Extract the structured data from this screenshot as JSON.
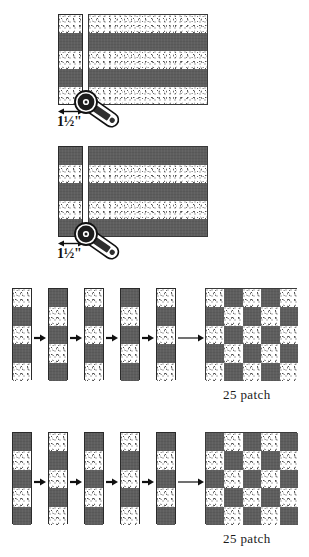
{
  "document": {
    "title": "Strip-Piecing 25-Patch Quilt Block Instructions",
    "type": "quilting-diagram"
  },
  "colors": {
    "dark_fabric": "#5e5e5e",
    "light_fabric": "#ffffff",
    "outline": "#2a2a2a",
    "text": "#1a1a1a"
  },
  "sections": [
    {
      "id": "strip-set-a",
      "measurement": "1½\"",
      "cut_strip_bands": [
        "light",
        "dark",
        "light",
        "dark",
        "light"
      ],
      "panel_bands": [
        "light",
        "dark",
        "light",
        "dark",
        "light"
      ],
      "tool": "rotary-cutter"
    },
    {
      "id": "strip-set-b",
      "measurement": "1½\"",
      "cut_strip_bands": [
        "dark",
        "light",
        "dark",
        "light",
        "dark"
      ],
      "panel_bands": [
        "dark",
        "light",
        "dark",
        "light",
        "dark"
      ],
      "tool": "rotary-cutter"
    },
    {
      "id": "assembly-a",
      "caption": "25  patch",
      "strips": [
        [
          "light",
          "dark",
          "light",
          "dark",
          "light"
        ],
        [
          "dark",
          "light",
          "dark",
          "light",
          "dark"
        ],
        [
          "light",
          "dark",
          "light",
          "dark",
          "light"
        ],
        [
          "dark",
          "light",
          "dark",
          "light",
          "dark"
        ],
        [
          "light",
          "dark",
          "light",
          "dark",
          "light"
        ]
      ],
      "block_grid": [
        [
          "light",
          "dark",
          "light",
          "dark",
          "light"
        ],
        [
          "dark",
          "light",
          "dark",
          "light",
          "dark"
        ],
        [
          "light",
          "dark",
          "light",
          "dark",
          "light"
        ],
        [
          "dark",
          "light",
          "dark",
          "light",
          "dark"
        ],
        [
          "light",
          "dark",
          "light",
          "dark",
          "light"
        ]
      ]
    },
    {
      "id": "assembly-b",
      "caption": "25  patch",
      "strips": [
        [
          "dark",
          "light",
          "dark",
          "light",
          "dark"
        ],
        [
          "light",
          "dark",
          "light",
          "dark",
          "light"
        ],
        [
          "dark",
          "light",
          "dark",
          "light",
          "dark"
        ],
        [
          "light",
          "dark",
          "light",
          "dark",
          "light"
        ],
        [
          "dark",
          "light",
          "dark",
          "light",
          "dark"
        ]
      ],
      "block_grid": [
        [
          "dark",
          "light",
          "dark",
          "light",
          "dark"
        ],
        [
          "light",
          "dark",
          "light",
          "dark",
          "light"
        ],
        [
          "dark",
          "light",
          "dark",
          "light",
          "dark"
        ],
        [
          "light",
          "dark",
          "light",
          "dark",
          "light"
        ],
        [
          "dark",
          "light",
          "dark",
          "light",
          "dark"
        ]
      ]
    }
  ]
}
